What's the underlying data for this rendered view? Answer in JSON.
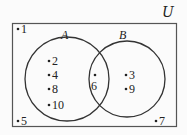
{
  "diagram": {
    "type": "venn",
    "universe_label": "U",
    "sets": [
      {
        "label": "A",
        "only_elements": [
          "2",
          "4",
          "8",
          "10"
        ]
      },
      {
        "label": "B",
        "only_elements": [
          "3",
          "9"
        ]
      }
    ],
    "intersection_elements": [
      "6"
    ],
    "outside_elements": [
      "1",
      "5",
      "7"
    ]
  },
  "labels": {
    "universe": "U",
    "set_a": "A",
    "set_b": "B",
    "e1": "1",
    "e2": "2",
    "e4": "4",
    "e8": "8",
    "e10": "10",
    "e6": "6",
    "e3": "3",
    "e9": "9",
    "e5": "5",
    "e7": "7"
  },
  "colors": {
    "stroke": "#333333",
    "background": "#fbfbfb"
  }
}
